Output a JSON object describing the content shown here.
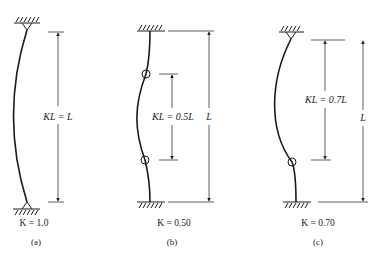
{
  "diagram": {
    "type": "effective-length-columns",
    "line_color": "#1a1a1a",
    "panels": [
      {
        "id": "a",
        "top_support": "pinned",
        "bottom_support": "pinned",
        "dimension_label": "KL = L",
        "k_label": "K = 1.0",
        "caption": "(a)"
      },
      {
        "id": "b",
        "top_support": "fixed",
        "bottom_support": "fixed",
        "dimension_label": "KL = 0.5L",
        "overall_label": "L",
        "k_label": "K = 0.50",
        "caption": "(b)"
      },
      {
        "id": "c",
        "top_support": "pinned",
        "bottom_support": "fixed",
        "dimension_label": "KL = 0.7L",
        "overall_label": "L",
        "k_label": "K = 0.70",
        "caption": "(c)"
      }
    ]
  }
}
